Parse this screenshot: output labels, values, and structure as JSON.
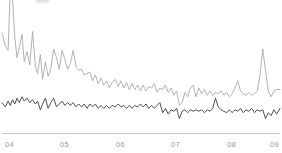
{
  "chart_data": {
    "type": "line",
    "title": "",
    "subtitle": "",
    "xlabel": "",
    "ylabel": "",
    "grid": false,
    "legend": "none",
    "xlim": [
      2004.0,
      2009.0
    ],
    "ylim": [
      0,
      100
    ],
    "x_tick_labels": [
      "04",
      "05",
      "06",
      "07",
      "08",
      "09"
    ],
    "x_tick_values": [
      2004,
      2005,
      2006,
      2007,
      2008,
      2009
    ],
    "axis_line_color": "#c9c9c9",
    "tick_label_color": "#9a9a9a",
    "background_color": "#ffffff",
    "series": [
      {
        "name": "upper-series",
        "color": "#a9a9a9",
        "line_width": 0.9,
        "x": [
          2004.0,
          2004.06,
          2004.11,
          2004.15,
          2004.19,
          2004.23,
          2004.27,
          2004.31,
          2004.36,
          2004.4,
          2004.45,
          2004.5,
          2004.55,
          2004.6,
          2004.64,
          2004.69,
          2004.73,
          2004.78,
          2004.83,
          2004.88,
          2004.93,
          2004.98,
          2005.03,
          2005.08,
          2005.13,
          2005.18,
          2005.23,
          2005.28,
          2005.33,
          2005.38,
          2005.43,
          2005.48,
          2005.53,
          2005.58,
          2005.63,
          2005.68,
          2005.73,
          2005.78,
          2005.83,
          2005.88,
          2005.93,
          2005.98,
          2006.04,
          2006.09,
          2006.14,
          2006.19,
          2006.24,
          2006.29,
          2006.34,
          2006.39,
          2006.44,
          2006.49,
          2006.54,
          2006.59,
          2006.64,
          2006.69,
          2006.74,
          2006.79,
          2006.84,
          2006.89,
          2006.94,
          2006.99,
          2007.04,
          2007.09,
          2007.14,
          2007.19,
          2007.24,
          2007.29,
          2007.34,
          2007.39,
          2007.44,
          2007.49,
          2007.54,
          2007.59,
          2007.64,
          2007.69,
          2007.74,
          2007.79,
          2007.84,
          2007.89,
          2007.94,
          2007.99,
          2008.04,
          2008.09,
          2008.14,
          2008.19,
          2008.24,
          2008.29,
          2008.34,
          2008.39,
          2008.44,
          2008.49,
          2008.54,
          2008.59,
          2008.64,
          2008.69,
          2008.74,
          2008.79,
          2008.84,
          2008.89,
          2008.94,
          2009.0
        ],
        "values": [
          69,
          60,
          57,
          101,
          92,
          66,
          52,
          59,
          68,
          49,
          56,
          47,
          70,
          46,
          41,
          54,
          37,
          49,
          39,
          45,
          58,
          52,
          44,
          57,
          51,
          44,
          48,
          57,
          46,
          43,
          44,
          40,
          41,
          42,
          36,
          40,
          34,
          38,
          33,
          36,
          31,
          35,
          37,
          32,
          36,
          31,
          35,
          30,
          34,
          30,
          33,
          29,
          33,
          29,
          32,
          31,
          34,
          28,
          31,
          30,
          33,
          28,
          31,
          26,
          29,
          19,
          21,
          28,
          25,
          31,
          33,
          25,
          31,
          27,
          30,
          26,
          29,
          26,
          28,
          27,
          29,
          26,
          28,
          25,
          27,
          31,
          36,
          29,
          27,
          26,
          28,
          26,
          27,
          29,
          40,
          58,
          43,
          29,
          25,
          29,
          30,
          30
        ]
      },
      {
        "name": "lower-series",
        "color": "#4f4f4f",
        "line_width": 1.0,
        "x": [
          2004.0,
          2004.06,
          2004.11,
          2004.15,
          2004.19,
          2004.23,
          2004.27,
          2004.31,
          2004.36,
          2004.4,
          2004.45,
          2004.5,
          2004.55,
          2004.6,
          2004.64,
          2004.69,
          2004.73,
          2004.78,
          2004.83,
          2004.88,
          2004.93,
          2004.98,
          2005.03,
          2005.08,
          2005.13,
          2005.18,
          2005.23,
          2005.28,
          2005.33,
          2005.38,
          2005.43,
          2005.48,
          2005.53,
          2005.58,
          2005.63,
          2005.68,
          2005.73,
          2005.78,
          2005.83,
          2005.88,
          2005.93,
          2005.98,
          2006.04,
          2006.09,
          2006.14,
          2006.19,
          2006.24,
          2006.29,
          2006.34,
          2006.39,
          2006.44,
          2006.49,
          2006.54,
          2006.59,
          2006.64,
          2006.69,
          2006.74,
          2006.79,
          2006.84,
          2006.89,
          2006.94,
          2006.99,
          2007.04,
          2007.09,
          2007.14,
          2007.19,
          2007.24,
          2007.29,
          2007.34,
          2007.39,
          2007.44,
          2007.49,
          2007.54,
          2007.59,
          2007.64,
          2007.69,
          2007.74,
          2007.79,
          2007.84,
          2007.89,
          2007.94,
          2007.99,
          2008.04,
          2008.09,
          2008.14,
          2008.19,
          2008.24,
          2008.29,
          2008.34,
          2008.39,
          2008.44,
          2008.49,
          2008.54,
          2008.59,
          2008.64,
          2008.69,
          2008.74,
          2008.79,
          2008.84,
          2008.89,
          2008.94,
          2009.0
        ],
        "values": [
          21,
          18,
          22,
          19,
          23,
          20,
          24,
          21,
          25,
          22,
          24,
          21,
          23,
          20,
          22,
          16,
          20,
          24,
          17,
          21,
          24,
          18,
          20,
          22,
          19,
          21,
          19,
          21,
          18,
          20,
          18,
          20,
          17,
          20,
          18,
          20,
          17,
          19,
          17,
          19,
          17,
          19,
          18,
          20,
          18,
          19,
          17,
          19,
          17,
          19,
          18,
          20,
          18,
          20,
          17,
          19,
          17,
          19,
          21,
          14,
          17,
          13,
          16,
          15,
          17,
          10,
          15,
          16,
          14,
          16,
          15,
          16,
          15,
          16,
          14,
          16,
          15,
          17,
          24,
          18,
          16,
          15,
          14,
          16,
          14,
          16,
          15,
          17,
          14,
          16,
          15,
          17,
          14,
          16,
          15,
          16,
          10,
          14,
          12,
          16,
          13,
          17
        ]
      }
    ]
  },
  "axis": {
    "ticks": [
      {
        "label": "04",
        "x_px": 5
      },
      {
        "label": "05",
        "x_px": 60
      },
      {
        "label": "06",
        "x_px": 116
      },
      {
        "label": "07",
        "x_px": 171
      },
      {
        "label": "08",
        "x_px": 227
      },
      {
        "label": "09",
        "x_px": 270
      }
    ]
  }
}
